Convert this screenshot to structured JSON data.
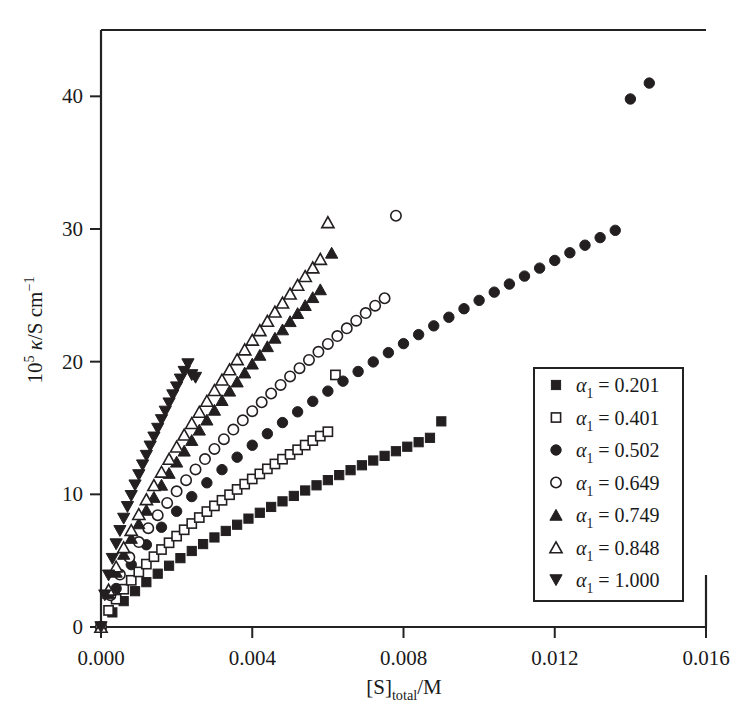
{
  "chart_data": {
    "type": "scatter",
    "title": "",
    "xlabel": "[S]_total/M",
    "xlabel_parts": {
      "bracket_open": "[S]",
      "subscript": "total",
      "tail": "/M"
    },
    "ylabel": "10^5 kappa/S cm^-1",
    "ylabel_parts": {
      "base": "10",
      "exp": "5",
      "kappa": "κ",
      "tail": "/S cm",
      "tail_exp": "−1"
    },
    "xlim": [
      0.0,
      0.016
    ],
    "ylim": [
      0.0,
      45.0
    ],
    "xticks": [
      0.0,
      0.004,
      0.008,
      0.012,
      0.016
    ],
    "xticklabels": [
      "0.000",
      "0.004",
      "0.008",
      "0.012",
      "0.016"
    ],
    "yticks": [
      0,
      10,
      20,
      30,
      40
    ],
    "yticklabels": [
      "0",
      "10",
      "20",
      "30",
      "40"
    ],
    "grid": false,
    "legend_position": "lower-right",
    "series": [
      {
        "name": "α₁ = 0.201",
        "alpha": "0.201",
        "marker": "filled-square",
        "x": [
          0.0,
          0.0003,
          0.0006,
          0.0009,
          0.0012,
          0.0015,
          0.0018,
          0.0021,
          0.0024,
          0.0027,
          0.003,
          0.0033,
          0.0036,
          0.0039,
          0.0042,
          0.0045,
          0.0048,
          0.0051,
          0.0054,
          0.0057,
          0.006,
          0.0063,
          0.0066,
          0.0069,
          0.0072,
          0.0075,
          0.0078,
          0.0081,
          0.0084,
          0.0087,
          0.009
        ],
        "y": [
          0.0,
          1.1,
          1.95,
          2.7,
          3.38,
          4.02,
          4.62,
          5.19,
          5.73,
          6.25,
          6.75,
          7.24,
          7.71,
          8.17,
          8.61,
          9.05,
          9.47,
          9.88,
          10.29,
          10.68,
          11.07,
          11.45,
          11.82,
          12.19,
          12.55,
          12.9,
          13.25,
          13.59,
          13.93,
          14.26,
          15.5
        ]
      },
      {
        "name": "α₁ = 0.401",
        "alpha": "0.401",
        "marker": "open-square",
        "x": [
          0.0,
          0.0002,
          0.0004,
          0.0006,
          0.0008,
          0.001,
          0.0012,
          0.0014,
          0.0016,
          0.0018,
          0.002,
          0.0022,
          0.0024,
          0.0026,
          0.0028,
          0.003,
          0.0032,
          0.0034,
          0.0036,
          0.0038,
          0.004,
          0.0042,
          0.0044,
          0.0046,
          0.0048,
          0.005,
          0.0052,
          0.0054,
          0.0056,
          0.0058,
          0.006,
          0.0062
        ],
        "y": [
          0.0,
          1.25,
          2.1,
          2.85,
          3.52,
          4.15,
          4.74,
          5.3,
          5.84,
          6.35,
          6.85,
          7.33,
          7.8,
          8.25,
          8.7,
          9.13,
          9.55,
          9.97,
          10.37,
          10.77,
          11.16,
          11.54,
          11.92,
          12.29,
          12.65,
          13.01,
          13.36,
          13.71,
          14.05,
          14.39,
          14.72,
          19.0
        ]
      },
      {
        "name": "α₁ = 0.502",
        "alpha": "0.502",
        "marker": "filled-circle",
        "x": [
          0.0,
          0.0004,
          0.0008,
          0.0012,
          0.0016,
          0.002,
          0.0024,
          0.0028,
          0.0032,
          0.0036,
          0.004,
          0.0044,
          0.0048,
          0.0052,
          0.0056,
          0.006,
          0.0064,
          0.0068,
          0.0072,
          0.0076,
          0.008,
          0.0084,
          0.0088,
          0.0092,
          0.0096,
          0.01,
          0.0104,
          0.0108,
          0.0112,
          0.0116,
          0.012,
          0.0124,
          0.0128,
          0.0132,
          0.0136,
          0.014,
          0.0145
        ],
        "y": [
          0.0,
          2.9,
          4.7,
          6.2,
          7.52,
          8.72,
          9.83,
          10.87,
          11.86,
          12.8,
          13.7,
          14.57,
          15.41,
          16.22,
          17.01,
          17.78,
          18.53,
          19.26,
          19.98,
          20.68,
          21.36,
          22.04,
          22.7,
          23.35,
          23.99,
          24.62,
          25.24,
          25.85,
          26.45,
          27.05,
          27.63,
          28.21,
          28.78,
          29.35,
          29.9,
          39.8,
          41.0
        ]
      },
      {
        "name": "α₁ = 0.649",
        "alpha": "0.649",
        "marker": "open-circle",
        "x": [
          0.0,
          0.00025,
          0.0005,
          0.00075,
          0.001,
          0.00125,
          0.0015,
          0.00175,
          0.002,
          0.00225,
          0.0025,
          0.00275,
          0.003,
          0.00325,
          0.0035,
          0.00375,
          0.004,
          0.00425,
          0.0045,
          0.00475,
          0.005,
          0.00525,
          0.0055,
          0.00575,
          0.006,
          0.00625,
          0.0065,
          0.00675,
          0.007,
          0.00725,
          0.0075,
          0.0078
        ],
        "y": [
          0.0,
          2.4,
          3.95,
          5.25,
          6.4,
          7.45,
          8.43,
          9.35,
          10.23,
          11.07,
          11.88,
          12.66,
          13.42,
          14.16,
          14.88,
          15.58,
          16.27,
          16.94,
          17.6,
          18.25,
          18.89,
          19.51,
          20.13,
          20.74,
          21.34,
          21.93,
          22.51,
          23.09,
          23.66,
          24.22,
          24.78,
          31.0
        ]
      },
      {
        "name": "α₁ = 0.749",
        "alpha": "0.749",
        "marker": "filled-triangle-up",
        "x": [
          0.0,
          0.0002,
          0.0004,
          0.0006,
          0.0008,
          0.001,
          0.0012,
          0.0014,
          0.0016,
          0.0018,
          0.002,
          0.0022,
          0.0024,
          0.0026,
          0.0028,
          0.003,
          0.0032,
          0.0034,
          0.0036,
          0.0038,
          0.004,
          0.0042,
          0.0044,
          0.0046,
          0.0048,
          0.005,
          0.0052,
          0.0054,
          0.0056,
          0.0058,
          0.0061
        ],
        "y": [
          0.0,
          2.55,
          4.15,
          5.5,
          6.7,
          7.8,
          8.82,
          9.79,
          10.71,
          11.6,
          12.45,
          13.28,
          14.08,
          14.86,
          15.62,
          16.36,
          17.09,
          17.8,
          18.49,
          19.17,
          19.84,
          20.5,
          21.15,
          21.79,
          22.42,
          23.04,
          23.65,
          24.25,
          24.85,
          25.44,
          28.2
        ]
      },
      {
        "name": "α₁ = 0.848",
        "alpha": "0.848",
        "marker": "open-triangle-up",
        "x": [
          0.0,
          0.0002,
          0.0004,
          0.0006,
          0.0008,
          0.001,
          0.0012,
          0.0014,
          0.0016,
          0.0018,
          0.002,
          0.0022,
          0.0024,
          0.0026,
          0.0028,
          0.003,
          0.0032,
          0.0034,
          0.0036,
          0.0038,
          0.004,
          0.0042,
          0.0044,
          0.0046,
          0.0048,
          0.005,
          0.0052,
          0.0054,
          0.0056,
          0.0058,
          0.006
        ],
        "y": [
          0.0,
          2.8,
          4.55,
          6.0,
          7.3,
          8.5,
          9.62,
          10.68,
          11.69,
          12.66,
          13.59,
          14.49,
          15.36,
          16.21,
          17.04,
          17.85,
          18.64,
          19.41,
          20.17,
          20.91,
          21.64,
          22.36,
          23.06,
          23.76,
          24.44,
          25.12,
          25.78,
          26.44,
          27.09,
          27.73,
          30.5
        ]
      },
      {
        "name": "α₁ = 1.000",
        "alpha": "1.000",
        "marker": "filled-triangle-down",
        "x": [
          0.0,
          0.0001,
          0.0002,
          0.0003,
          0.0004,
          0.0005,
          0.0006,
          0.0007,
          0.0008,
          0.0009,
          0.001,
          0.0011,
          0.0012,
          0.0013,
          0.0014,
          0.0015,
          0.0016,
          0.0017,
          0.0018,
          0.0019,
          0.002,
          0.0021,
          0.0022,
          0.0023,
          0.0024,
          0.0025
        ],
        "y": [
          0.0,
          2.4,
          3.9,
          5.15,
          6.25,
          7.25,
          8.18,
          9.06,
          9.89,
          10.69,
          11.46,
          12.2,
          12.92,
          13.62,
          14.3,
          14.96,
          15.61,
          16.25,
          16.87,
          17.48,
          18.08,
          18.67,
          19.25,
          19.82,
          19.0,
          18.8
        ]
      }
    ]
  },
  "legend": {
    "items": [
      {
        "marker": "filled-square",
        "label": "α",
        "sub": "1",
        "eq": " = ",
        "value": "0.201"
      },
      {
        "marker": "open-square",
        "label": "α",
        "sub": "1",
        "eq": " = ",
        "value": "0.401"
      },
      {
        "marker": "filled-circle",
        "label": "α",
        "sub": "1",
        "eq": " = ",
        "value": "0.502"
      },
      {
        "marker": "open-circle",
        "label": "α",
        "sub": "1",
        "eq": " = ",
        "value": "0.649"
      },
      {
        "marker": "filled-triangle-up",
        "label": "α",
        "sub": "1",
        "eq": " = ",
        "value": "0.749"
      },
      {
        "marker": "open-triangle-up",
        "label": "α",
        "sub": "1",
        "eq": " = ",
        "value": "0.848"
      },
      {
        "marker": "filled-triangle-down",
        "label": "α",
        "sub": "1",
        "eq": " = ",
        "value": "1.000"
      }
    ]
  },
  "colors": {
    "marker": "#231f20",
    "axis": "#222222",
    "background": "#ffffff"
  }
}
